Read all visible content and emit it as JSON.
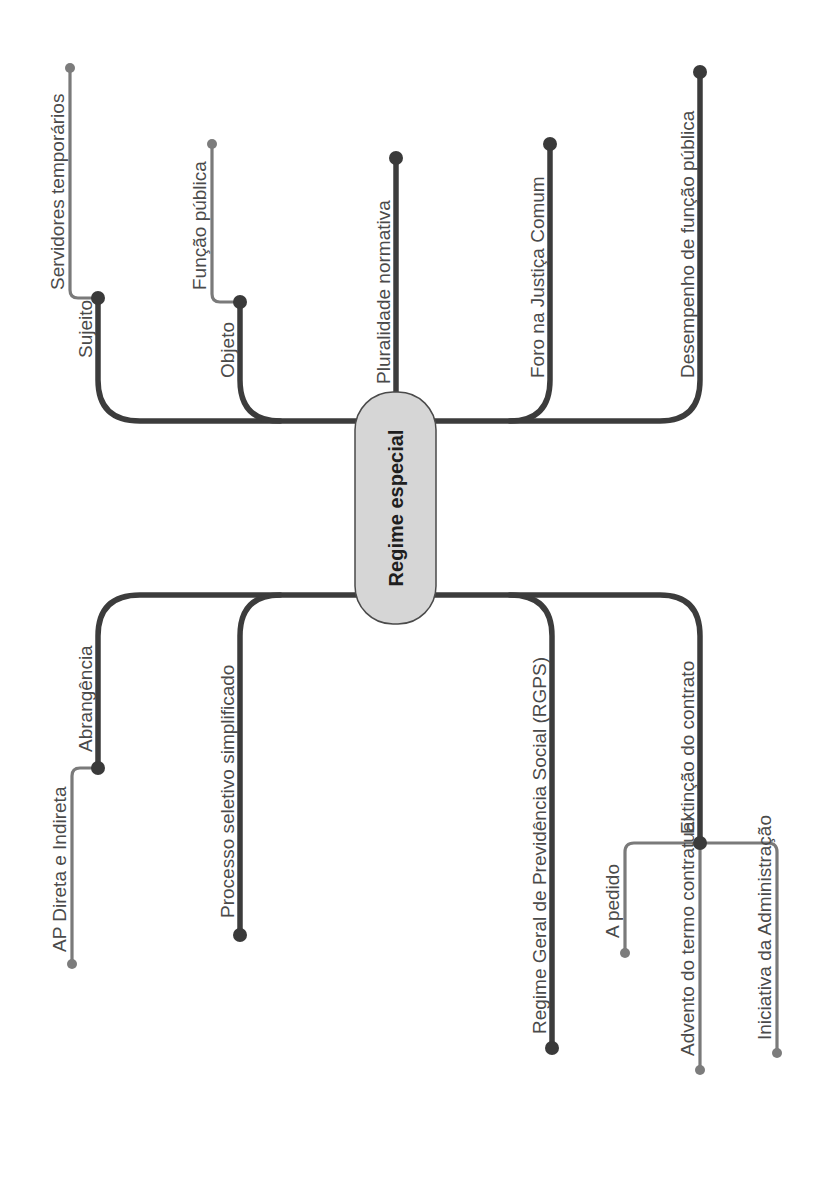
{
  "diagram": {
    "type": "mind-map",
    "orientation": "rotated-90-ccw",
    "colors": {
      "main_branch": "#3c3c3c",
      "sub_branch": "#7a7a7a",
      "center_fill": "#d6d6d6",
      "text": "#4a4a4a"
    },
    "center": {
      "label": "Regime especial"
    },
    "branches": [
      {
        "label": "Sujeito",
        "children": [
          {
            "label": "Servidores temporários"
          }
        ]
      },
      {
        "label": "Objeto",
        "children": [
          {
            "label": "Função pública"
          }
        ]
      },
      {
        "label": "Pluralidade normativa",
        "children": []
      },
      {
        "label": "Foro na Justiça Comum",
        "children": []
      },
      {
        "label": "Desempenho de função pública",
        "children": []
      },
      {
        "label": "Abrangência",
        "children": [
          {
            "label": "AP Direta e Indireta"
          }
        ]
      },
      {
        "label": "Processo seletivo simplificado",
        "children": []
      },
      {
        "label": "Regime Geral de Previdência Social (RGPS)",
        "children": []
      },
      {
        "label": "Extinção do contrato",
        "children": [
          {
            "label": "A pedido"
          },
          {
            "label": "Advento do termo contratual"
          },
          {
            "label": "Iniciativa da Administração"
          }
        ]
      }
    ]
  }
}
